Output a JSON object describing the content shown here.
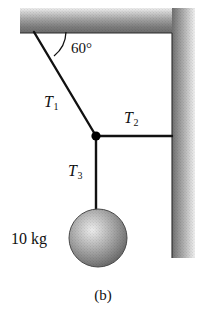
{
  "figure": {
    "caption": "(b)",
    "background_color": "#ffffff",
    "width": 206,
    "height": 320
  },
  "labels": {
    "tension_1": "T",
    "tension_1_sub": "1",
    "tension_2": "T",
    "tension_2_sub": "2",
    "tension_3": "T",
    "tension_3_sub": "3",
    "angle": "60°",
    "mass": "10 kg"
  },
  "icons": {
    "ceiling": "ceiling-support-icon",
    "wall": "wall-support-icon",
    "sphere": "hanging-mass-sphere-icon",
    "junction": "rope-junction-node-icon",
    "arc": "angle-arc-icon"
  },
  "colors": {
    "line": "#111111",
    "node": "#000000",
    "support_light": "#e8e8e8",
    "support_dark": "#6a6a6a",
    "sphere_highlight": "#e2e2e2",
    "sphere_shadow": "#5a5a5a"
  },
  "geometry": {
    "ceiling_anchor": "34,32",
    "junction": "96,136",
    "wall_anchor": "172,136",
    "sphere_center": "98,238",
    "sphere_radius": "29",
    "angle_degrees": "60",
    "mass_kilograms": "10"
  }
}
